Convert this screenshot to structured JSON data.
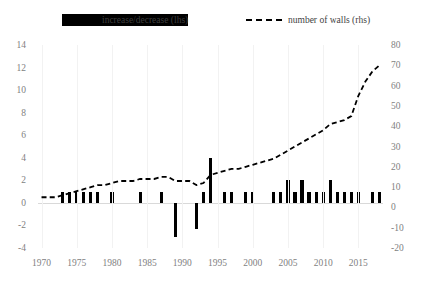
{
  "legend": {
    "bar_label": "increase/decrease (lhs)",
    "line_label": "number of walls (rhs)",
    "bar_color": "#000000",
    "line_color": "#000000"
  },
  "axes": {
    "left_ticks": [
      "14",
      "12",
      "10",
      "8",
      "6",
      "4",
      "2",
      "0",
      "-2",
      "-4"
    ],
    "right_ticks": [
      "80",
      "70",
      "60",
      "50",
      "40",
      "30",
      "20",
      "10",
      "0",
      "-10",
      "-20"
    ],
    "x_ticks": [
      "1970",
      "1975",
      "1980",
      "1985",
      "1990",
      "1995",
      "2000",
      "2005",
      "2010",
      "2015"
    ]
  },
  "chart_data": {
    "type": "bar",
    "title": "",
    "xlabel": "",
    "ylabel": "",
    "y2label": "",
    "ylim": [
      -4,
      14
    ],
    "y2lim": [
      -20,
      80
    ],
    "grid": false,
    "legend_position": "top",
    "x": [
      1970,
      1971,
      1972,
      1973,
      1974,
      1975,
      1976,
      1977,
      1978,
      1979,
      1980,
      1981,
      1982,
      1983,
      1984,
      1985,
      1986,
      1987,
      1988,
      1989,
      1990,
      1991,
      1992,
      1993,
      1994,
      1995,
      1996,
      1997,
      1998,
      1999,
      2000,
      2001,
      2002,
      2003,
      2004,
      2005,
      2006,
      2007,
      2008,
      2009,
      2010,
      2011,
      2012,
      2013,
      2014,
      2015,
      2016,
      2017,
      2018
    ],
    "series": [
      {
        "name": "increase/decrease (lhs)",
        "axis": "left",
        "type": "bar",
        "values": [
          0,
          0,
          0,
          1,
          1,
          1,
          1,
          1,
          1,
          0,
          1,
          0,
          0,
          0,
          1,
          0,
          0,
          1,
          0,
          -3,
          0,
          0,
          -2.3,
          1,
          4,
          0,
          1,
          1,
          0,
          1,
          1,
          0,
          0,
          1,
          1,
          2,
          1,
          2,
          1,
          1,
          1,
          2,
          1,
          1,
          1,
          1,
          0,
          1,
          1
        ]
      },
      {
        "name": "number of walls (rhs)",
        "axis": "right",
        "type": "line",
        "values": [
          5,
          5,
          5,
          6,
          7,
          8,
          9,
          10,
          11,
          11,
          12,
          13,
          13,
          13,
          14,
          14,
          14,
          15,
          15,
          13,
          13,
          13,
          11,
          12,
          16,
          17,
          18,
          19,
          19,
          20,
          21,
          22,
          23,
          24,
          26,
          28,
          30,
          32,
          34,
          36,
          38,
          41,
          42,
          43,
          45,
          55,
          62,
          67,
          70
        ]
      }
    ]
  }
}
